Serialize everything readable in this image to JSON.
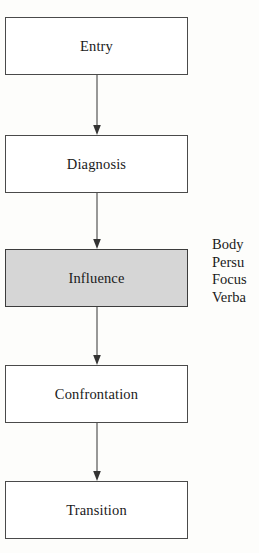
{
  "diagram": {
    "type": "flowchart",
    "orientation": "vertical",
    "background_color": "#fdfdfb",
    "border_color": "#4a4a4a",
    "highlight_fill": "#d6d6d6",
    "nodes": [
      {
        "id": "entry",
        "label": "Entry",
        "highlighted": false
      },
      {
        "id": "diagnosis",
        "label": "Diagnosis",
        "highlighted": false
      },
      {
        "id": "influence",
        "label": "Influence",
        "highlighted": true
      },
      {
        "id": "confrontation",
        "label": "Confrontation",
        "highlighted": false
      },
      {
        "id": "transition",
        "label": "Transition",
        "highlighted": false
      }
    ],
    "connectors": [
      {
        "id": "entry-to-diagnosis",
        "from": "entry",
        "to": "diagnosis",
        "style": "arrow-down"
      },
      {
        "id": "diagnosis-to-influence",
        "from": "diagnosis",
        "to": "influence",
        "style": "arrow-down"
      },
      {
        "id": "influence-to-confrontation",
        "from": "influence",
        "to": "confrontation",
        "style": "arrow-down"
      },
      {
        "id": "confrontation-to-transition",
        "from": "confrontation",
        "to": "transition",
        "style": "arrow-down"
      }
    ],
    "side_notes": {
      "attached_to": "influence",
      "clipped_at_right_edge": true,
      "lines": [
        {
          "id": "note-body",
          "text": "Body"
        },
        {
          "id": "note-persu",
          "text": "Persu"
        },
        {
          "id": "note-focus",
          "text": "Focus"
        },
        {
          "id": "note-verba",
          "text": "Verba"
        }
      ]
    }
  }
}
